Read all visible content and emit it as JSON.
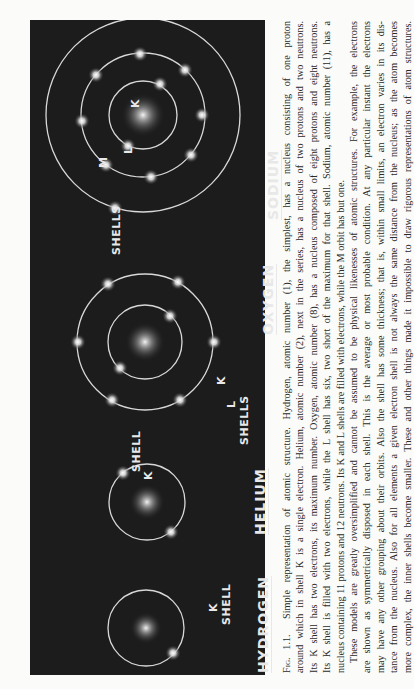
{
  "figure": {
    "atoms": [
      {
        "name": "HYDROGEN",
        "nucleus_top": "1+",
        "nucleus_bottom": "",
        "shell_labels": [
          "K",
          "SHELL"
        ]
      },
      {
        "name": "HELIUM",
        "nucleus_top": "2+",
        "nucleus_bottom": "2N",
        "shell_labels": [
          "SHELL",
          "K"
        ]
      },
      {
        "name": "OXYGEN",
        "nucleus_top": "8+",
        "nucleus_bottom": "8N",
        "shell_labels": [
          "K",
          "L",
          "SHELLS"
        ]
      },
      {
        "name": "SODIUM",
        "nucleus_top": "11+",
        "nucleus_bottom": "12N",
        "shell_labels": [
          "K",
          "L",
          "M",
          "SHELLS"
        ]
      }
    ],
    "electron_glyph": "0"
  },
  "caption": {
    "fig_label": "Fig. 1.1.",
    "lines": [
      "Simple representation of atomic structure. Hydrogen, atomic number (1), the simplest, has a nucleus consisting of one proton",
      "around which in shell K is a single electron. Helium, atomic number (2), next in the series, has a nucleus of two protons and two neutrons.",
      "Its K shell has two electrons, its maximum number. Oxygen, atomic number (8), has a nucleus composed of eight protons and eight neutrons.",
      "Its K shell is filled with two electrons, while the L shell has six, two short of the maximum for that shell. Sodium, atomic number (11), has a",
      "nucleus containing 11 protons and 12 neutrons. Its K and L shells are filled with electrons, while the M orbit has but one."
    ],
    "paragraph2": [
      "These models are greatly oversimplified and cannot be assumed to be physical likenesses of atomic structures. For example, the electrons",
      "are shown as symmetrically disposed in each shell. This is the average or most probable condition. At any particular instant the electrons",
      "may have any other grouping about their orbits. Also the shell has some thickness; that is, within small limits, an electron varies in its dis-",
      "tance from the nucleus. Also for all elements a given electron shell is not always the same distance from the nucleus; as the atom becomes",
      "more complex, the inner shells become smaller. These and other things made it impossible to draw rigorous representations of atom structures."
    ]
  }
}
